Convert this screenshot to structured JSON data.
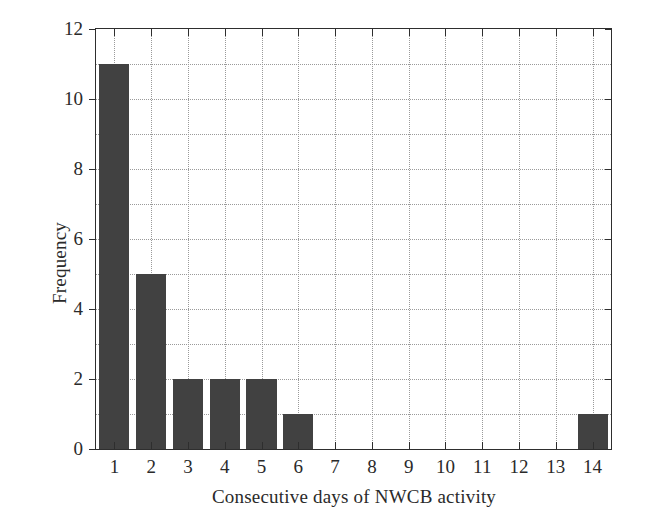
{
  "chart_data": {
    "type": "bar",
    "title": "",
    "subtitle": "",
    "xlabel": "Consecutive days of NWCB activity",
    "ylabel": "Frequency",
    "categories": [
      "1",
      "2",
      "3",
      "4",
      "5",
      "6",
      "7",
      "8",
      "9",
      "10",
      "11",
      "12",
      "13",
      "14"
    ],
    "values": [
      11,
      5,
      2,
      2,
      2,
      1,
      0,
      0,
      0,
      0,
      0,
      0,
      0,
      1
    ],
    "series": [
      {
        "name": "Frequency",
        "values": [
          11,
          5,
          2,
          2,
          2,
          1,
          0,
          0,
          0,
          0,
          0,
          0,
          0,
          1
        ]
      }
    ],
    "xlim": [
      0.5,
      14.5
    ],
    "ylim": [
      0,
      12
    ],
    "ytick_labels": [
      "0",
      "2",
      "4",
      "6",
      "8",
      "10",
      "12"
    ],
    "ytick_values": [
      0,
      2,
      4,
      6,
      8,
      10,
      12
    ],
    "yminor_step": 1,
    "xtick_labels": [
      "1",
      "2",
      "3",
      "4",
      "5",
      "6",
      "7",
      "8",
      "9",
      "10",
      "11",
      "12",
      "13",
      "14"
    ],
    "grid": true,
    "grid_style": "dotted",
    "legend": null,
    "legend_position": "none",
    "annotations": [],
    "colors": {
      "bar_fill": "#414141",
      "axis": "#2e2e2e",
      "grid": "#9a9a9a",
      "text": "#2a2a2a",
      "background": "#ffffff"
    }
  }
}
